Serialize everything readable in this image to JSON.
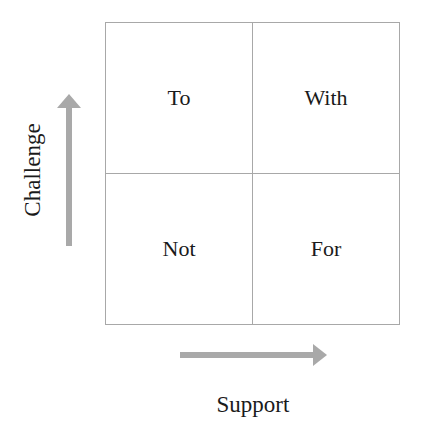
{
  "quadrants": {
    "top_left": "To",
    "top_right": "With",
    "bottom_left": "Not",
    "bottom_right": "For"
  },
  "axes": {
    "y_label": "Challenge",
    "x_label": "Support"
  },
  "colors": {
    "grid_line": "#a8a8a8",
    "arrow": "#a9a9a9",
    "text": "#1a1a1a"
  }
}
